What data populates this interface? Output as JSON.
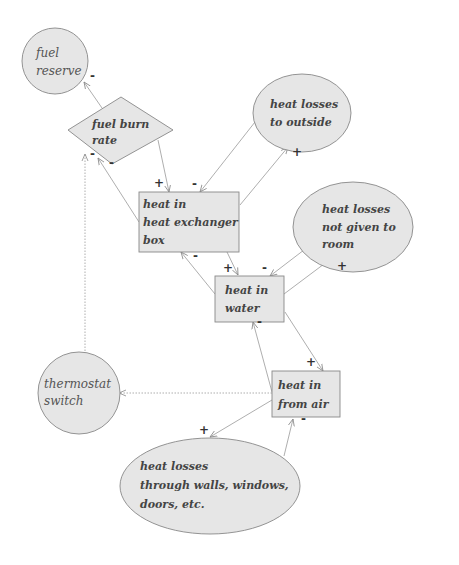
{
  "nodes": {
    "fuel_reserve": {
      "line1": "fuel",
      "line2": "reserve"
    },
    "fuel_burn_rate": {
      "line1": "fuel burn",
      "line2": "rate"
    },
    "heat_losses_outside": {
      "line1": "heat losses",
      "line2": "to outside"
    },
    "heat_exchanger": {
      "line1": "heat in",
      "line2": "heat exchanger",
      "line3": "box"
    },
    "heat_losses_room": {
      "line1": "heat losses",
      "line2": "not given to",
      "line3": "room"
    },
    "heat_water": {
      "line1": "heat in",
      "line2": "water"
    },
    "thermostat": {
      "line1": "thermostat",
      "line2": "switch"
    },
    "heat_air": {
      "line1": "heat in",
      "line2": "from air"
    },
    "heat_losses_walls": {
      "line1": "heat losses",
      "line2": "through walls, windows,",
      "line3": "doors, etc."
    }
  },
  "signs": {
    "s1": "-",
    "s2": "+",
    "s3": "-",
    "s4": "+",
    "s5": "-",
    "s6": "-",
    "s7": "+",
    "s8": "-",
    "s9": "+",
    "s10": "-",
    "s11": "+",
    "s12": "+",
    "s13": "-",
    "s14": "-"
  },
  "colors": {
    "node_fill": "#e6e6e6",
    "stroke": "#888888",
    "arrow": "#999999"
  }
}
